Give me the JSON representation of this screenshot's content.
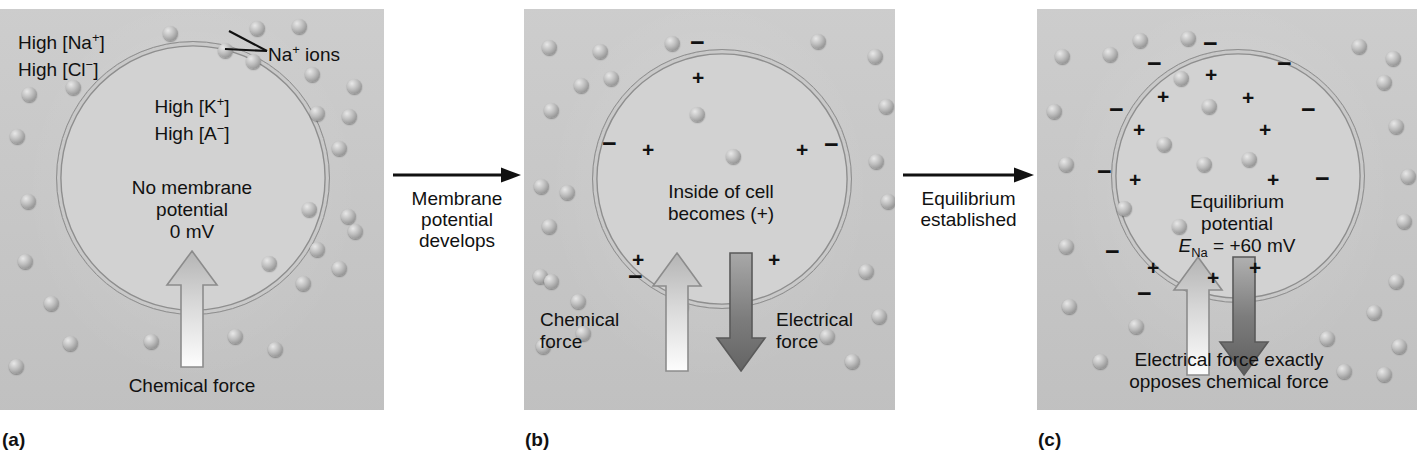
{
  "figure": {
    "background_color": "#ffffff",
    "panel_color": "#c9c9c9",
    "cell_color": "#d2d2d2",
    "membrane_color": "#8e8e8e"
  },
  "panels": [
    {
      "id": "a",
      "caption": "(a)",
      "outside_labels": [
        {
          "line1": "High [Na",
          "sup1": "+",
          "line1_end": "]"
        },
        {
          "line2": "High [Cl",
          "sup2": "−",
          "line2_end": "]"
        }
      ],
      "outside_text_line1": "High [Na+]",
      "outside_text_line2": "High [Cl−]",
      "inside_text_line1": "High [K+]",
      "inside_text_line2": "High [A−]",
      "center_text_line1": "No membrane",
      "center_text_line2": "potential",
      "center_text_line3": "0 mV",
      "pointer_label": "Na+ ions",
      "force_label": "Chemical force",
      "forces": [
        {
          "name": "chemical-force",
          "direction": "up",
          "label": "Chemical force",
          "color": "light"
        }
      ],
      "membrane_potential_mv": 0
    },
    {
      "id": "b",
      "caption": "(b)",
      "center_text_line1": "Inside of cell",
      "center_text_line2": "becomes (+)",
      "forces": [
        {
          "name": "chemical-force",
          "direction": "up",
          "label_line1": "Chemical",
          "label_line2": "force",
          "color": "light"
        },
        {
          "name": "electrical-force",
          "direction": "down",
          "label_line1": "Electrical",
          "label_line2": "force",
          "color": "dark"
        }
      ],
      "charge_note": "negative charges outside membrane, positive charges inside membrane"
    },
    {
      "id": "c",
      "caption": "(c)",
      "center_text_line1": "Equilibrium",
      "center_text_line2": "potential",
      "center_text_line3_prefix": "E",
      "center_text_line3_sub": "Na",
      "center_text_line3_suffix": " = +60 mV",
      "equilibrium_potential_mv": 60,
      "equilibrium_ion": "Na",
      "bottom_text_line1": "Electrical force exactly",
      "bottom_text_line2": "opposes chemical force",
      "forces": [
        {
          "name": "chemical-force",
          "direction": "up",
          "color": "light"
        },
        {
          "name": "electrical-force",
          "direction": "down",
          "color": "dark"
        }
      ]
    }
  ],
  "transitions": [
    {
      "id": "transition-1",
      "line1": "Membrane",
      "line2": "potential",
      "line3": "develops"
    },
    {
      "id": "transition-2",
      "line1": "Equilibrium",
      "line2": "established",
      "line3": ""
    }
  ],
  "ion_positions": {
    "panel_a_outside": [
      [
        163,
        17
      ],
      [
        218,
        34
      ],
      [
        250,
        12
      ],
      [
        292,
        10
      ],
      [
        246,
        45
      ],
      [
        22,
        78
      ],
      [
        66,
        71
      ],
      [
        305,
        58
      ],
      [
        347,
        70
      ],
      [
        310,
        97
      ],
      [
        342,
        100
      ],
      [
        10,
        120
      ],
      [
        332,
        132
      ],
      [
        21,
        185
      ],
      [
        302,
        193
      ],
      [
        341,
        200
      ],
      [
        18,
        245
      ],
      [
        310,
        233
      ],
      [
        348,
        215
      ],
      [
        44,
        287
      ],
      [
        262,
        247
      ],
      [
        296,
        267
      ],
      [
        332,
        252
      ],
      [
        63,
        327
      ],
      [
        144,
        325
      ],
      [
        228,
        320
      ],
      [
        268,
        333
      ],
      [
        9,
        350
      ]
    ],
    "panel_a_inside": [],
    "panel_b_outside": [
      [
        18,
        31
      ],
      [
        69,
        35
      ],
      [
        141,
        27
      ],
      [
        287,
        25
      ],
      [
        344,
        40
      ],
      [
        50,
        69
      ],
      [
        80,
        62
      ],
      [
        20,
        94
      ],
      [
        355,
        90
      ],
      [
        345,
        145
      ],
      [
        10,
        170
      ],
      [
        36,
        176
      ],
      [
        18,
        210
      ],
      [
        9,
        260
      ],
      [
        357,
        185
      ],
      [
        335,
        255
      ],
      [
        348,
        300
      ],
      [
        20,
        265
      ],
      [
        47,
        285
      ],
      [
        52,
        317
      ],
      [
        296,
        320
      ],
      [
        321,
        345
      ],
      [
        12,
        330
      ]
    ],
    "panel_b_inside": [
      [
        166,
        98
      ],
      [
        202,
        140
      ],
      [
        150,
        290
      ]
    ],
    "panel_c_outside": [
      [
        66,
        38
      ],
      [
        96,
        24
      ],
      [
        18,
        40
      ],
      [
        144,
        22
      ],
      [
        315,
        30
      ],
      [
        349,
        42
      ],
      [
        10,
        95
      ],
      [
        137,
        62
      ],
      [
        340,
        66
      ],
      [
        22,
        148
      ],
      [
        352,
        110
      ],
      [
        364,
        160
      ],
      [
        360,
        205
      ],
      [
        22,
        230
      ],
      [
        80,
        192
      ],
      [
        25,
        290
      ],
      [
        330,
        296
      ],
      [
        352,
        265
      ],
      [
        355,
        330
      ],
      [
        92,
        310
      ],
      [
        56,
        345
      ],
      [
        283,
        322
      ],
      [
        300,
        355
      ],
      [
        340,
        358
      ]
    ],
    "panel_c_inside": [
      [
        165,
        90
      ],
      [
        120,
        128
      ],
      [
        160,
        148
      ],
      [
        205,
        143
      ],
      [
        135,
        210
      ]
    ]
  },
  "charges": {
    "panel_b_outside_minus": [
      [
        166,
        21
      ],
      [
        78,
        122
      ],
      [
        300,
        123
      ],
      [
        104,
        255
      ]
    ],
    "panel_b_inside_plus": [
      [
        168,
        58
      ],
      [
        118,
        130
      ],
      [
        272,
        130
      ],
      [
        108,
        240
      ],
      [
        244,
        240
      ]
    ],
    "panel_c_outside_minus": [
      [
        166,
        22
      ],
      [
        110,
        42
      ],
      [
        240,
        42
      ],
      [
        72,
        88
      ],
      [
        264,
        88
      ],
      [
        60,
        150
      ],
      [
        278,
        157
      ],
      [
        68,
        230
      ],
      [
        100,
        272
      ]
    ],
    "panel_c_inside_plus": [
      [
        168,
        55
      ],
      [
        120,
        77
      ],
      [
        205,
        78
      ],
      [
        96,
        110
      ],
      [
        222,
        110
      ],
      [
        92,
        160
      ],
      [
        230,
        160
      ],
      [
        110,
        248
      ],
      [
        170,
        258
      ],
      [
        212,
        248
      ]
    ]
  }
}
